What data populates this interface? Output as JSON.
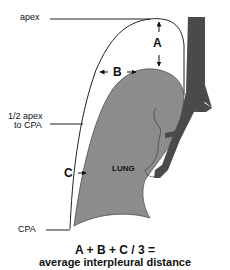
{
  "labels": {
    "apex": "apex",
    "half_apex_line1": "1/2 apex",
    "half_apex_line2": "to CPA",
    "cpa": "CPA",
    "lung": "LUNG",
    "measure_a": "A",
    "measure_b": "B",
    "measure_c": "C"
  },
  "formula": {
    "line1": "A + B + C / 3 =",
    "line2": "average interpleural distance"
  },
  "colors": {
    "lung_fill": "#8c8c8c",
    "airway_fill": "#4a4a4a",
    "outline": "#222222",
    "background": "#ffffff"
  }
}
